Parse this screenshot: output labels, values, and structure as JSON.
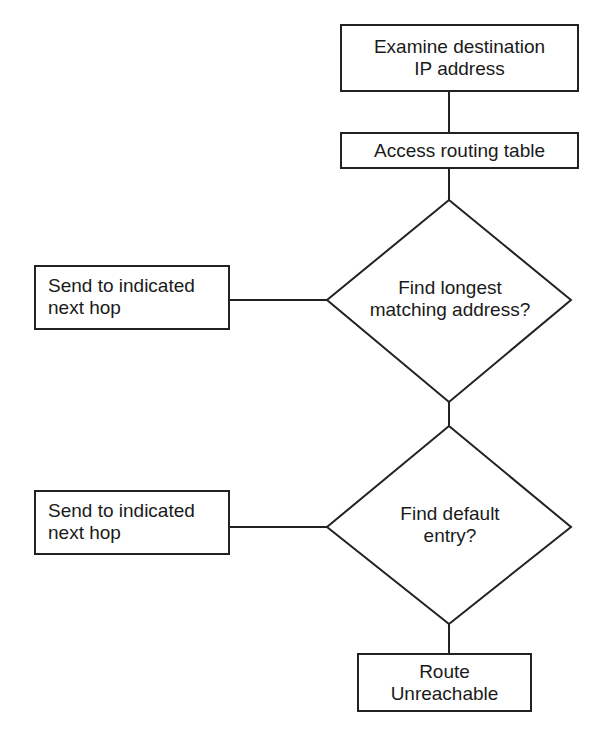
{
  "flowchart": {
    "nodes": {
      "examine": {
        "type": "process",
        "lines": [
          "Examine destination",
          "IP address"
        ]
      },
      "access": {
        "type": "process",
        "lines": [
          "Access routing table"
        ]
      },
      "longest": {
        "type": "decision",
        "lines": [
          "Find longest",
          "matching address?"
        ]
      },
      "send1": {
        "type": "process",
        "lines": [
          "Send to indicated",
          "next hop"
        ]
      },
      "default": {
        "type": "decision",
        "lines": [
          "Find default",
          "entry?"
        ]
      },
      "send2": {
        "type": "process",
        "lines": [
          "Send to indicated",
          "next hop"
        ]
      },
      "unreachable": {
        "type": "terminal",
        "lines": [
          "Route",
          "Unreachable"
        ]
      }
    },
    "edges": [
      {
        "from": "examine",
        "to": "access"
      },
      {
        "from": "access",
        "to": "longest"
      },
      {
        "from": "longest",
        "to": "send1"
      },
      {
        "from": "longest",
        "to": "default"
      },
      {
        "from": "default",
        "to": "send2"
      },
      {
        "from": "default",
        "to": "unreachable"
      }
    ],
    "stroke_color": "#222222"
  }
}
